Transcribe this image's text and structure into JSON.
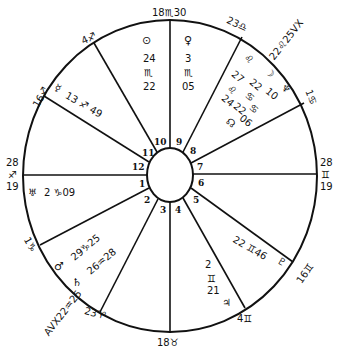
{
  "chart": {
    "type": "natal-horoscope-wheel",
    "colors": {
      "ink": "#111111",
      "paper": "#ffffff"
    },
    "center": {
      "x": 170,
      "y": 175
    },
    "outer_ring": {
      "rx": 148,
      "ry": 156
    },
    "inner_ring": {
      "rx": 23,
      "ry": 27
    },
    "cusps": [
      {
        "house": 1,
        "label": "28 ♐ 19",
        "deg_top": "28",
        "sign": "♐",
        "deg_bottom": "19",
        "x": 22,
        "y": 175
      },
      {
        "house": 2,
        "label": "1 ♑",
        "x": 40,
        "y": 245
      },
      {
        "house": 3,
        "label": "23 ♈",
        "x": 100,
        "y": 312
      },
      {
        "house": 4,
        "label": "18 ♉",
        "x": 170,
        "y": 332
      },
      {
        "house": 5,
        "label": "4 ♊",
        "x": 245,
        "y": 308
      },
      {
        "house": 6,
        "label": "16 ♊",
        "x": 293,
        "y": 262
      },
      {
        "house": 7,
        "label": "28 ♊ 19",
        "deg_top": "28",
        "sign": "♊",
        "deg_bottom": "19",
        "x": 317,
        "y": 174
      },
      {
        "house": 8,
        "label": "1 ♋",
        "x": 304,
        "y": 103
      },
      {
        "house": 9,
        "label": "23 ♎",
        "x": 242,
        "y": 37
      },
      {
        "house": 10,
        "label": "18 ♏ 30",
        "x": 170,
        "y": 19
      },
      {
        "house": 11,
        "label": "4 ♐",
        "x": 94,
        "y": 43
      },
      {
        "house": 12,
        "label": "16 ♐",
        "x": 44,
        "y": 96
      }
    ],
    "house_numbers": [
      "1",
      "2",
      "3",
      "4",
      "5",
      "6",
      "7",
      "8",
      "9",
      "10",
      "11",
      "12"
    ],
    "cusp_labels": {
      "mc": "18♏30",
      "c9": "23♎",
      "c8": "1♋",
      "asc_top": "28",
      "asc_sign": "♐",
      "asc_bottom": "19",
      "desc_top": "28",
      "desc_sign": "♊",
      "desc_bottom": "19",
      "c6": "16♊",
      "c5": "4♊",
      "ic": "18♉",
      "c3": "23♈",
      "c2": "1♑",
      "c12": "16♐",
      "c11": "4♐"
    },
    "planets": {
      "sun": {
        "glyph": "☉",
        "deg": "24",
        "sign": "♏",
        "min": "22"
      },
      "venus": {
        "glyph": "♀",
        "deg": "3",
        "sign": "♏",
        "min": "05"
      },
      "vertex": {
        "label": "22♌25VX"
      },
      "mars_9a": {
        "glyph": "♌",
        "deg": "27",
        "sign": "♌",
        "min": ""
      },
      "moon": {
        "glyph": "☽",
        "deg": "22",
        "sign": "♋",
        "min": "10"
      },
      "neptune": {
        "glyph": "♆"
      },
      "node": {
        "glyph": "☊",
        "deg": "24",
        "sign": "♋",
        "min": "22",
        "extra": "06"
      },
      "mercury": {
        "glyph": "☿",
        "deg": "13",
        "sign": "♐",
        "min": "49"
      },
      "uranus": {
        "glyph": "♅",
        "deg": "2",
        "sign": "♑",
        "min": "09"
      },
      "mars": {
        "glyph": "♂",
        "deg": "29",
        "sign": "♑",
        "min": "25"
      },
      "saturn": {
        "glyph": "♄",
        "deg": "26",
        "sign": "♒",
        "min": "28"
      },
      "antivertex": {
        "label": "AVX22♒25"
      },
      "jupiter": {
        "glyph": "♃",
        "deg": "2",
        "sign": "♊",
        "min": "21"
      },
      "pluto": {
        "glyph": "♇",
        "deg": "22",
        "sign": "♊",
        "min": "46"
      }
    },
    "text": {
      "sun_glyph": "⊙",
      "sun_deg": "24",
      "sun_sign": "♏",
      "sun_min": "22",
      "venus_glyph": "♀",
      "venus_deg": "3",
      "venus_sign": "♏",
      "venus_min": "05",
      "vx": "22♌25VX",
      "h9_sign": "♌",
      "h9_a": "27",
      "h9_b": "♌",
      "h9_c": "22",
      "h9_d": "♋",
      "h9_e": "10",
      "moon_glyph": "☽",
      "h8_a": "24",
      "h8_b": "22",
      "h8_c": "♋",
      "h8_d": "06",
      "h8_node": "☊",
      "neptune_glyph": "♆",
      "mercury_glyph": "☿",
      "mercury_pos": "13 ♐ 49",
      "uranus_glyph": "♅",
      "uranus_pos": "2 ♑09",
      "mars_glyph": "♂",
      "mars_pos": "29♑25",
      "saturn_glyph": "♄",
      "saturn_pos": "26♒28",
      "avx": "AVX22♒25",
      "jup_deg": "2",
      "jup_sign": "♊",
      "jup_min": "21",
      "jup_glyph": "♃",
      "pluto_pos": "22 ♊46",
      "pluto_glyph": "♇"
    }
  }
}
